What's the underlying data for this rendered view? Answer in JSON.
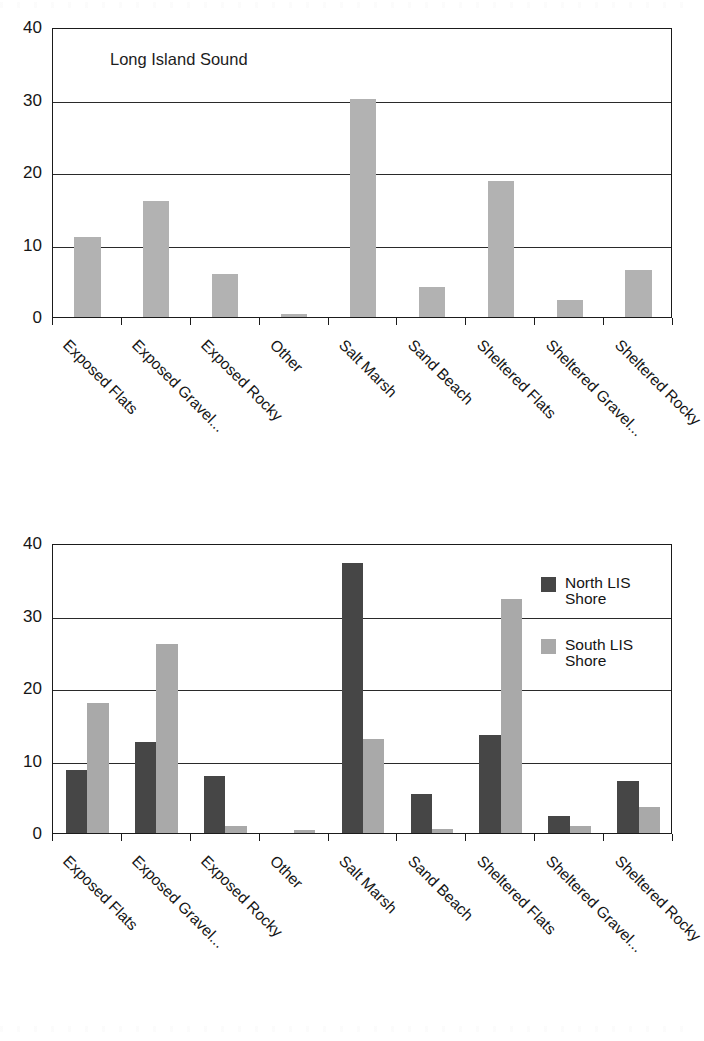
{
  "document": {
    "type": "scanned-figure-page",
    "page_background": "#ffffff"
  },
  "colors": {
    "north_series": "#464646",
    "south_series": "#a9a9a9",
    "single_series": "#b2b2b2",
    "axis": "#1b1b1b",
    "gridline": "#2a2a2a",
    "text": "#161616"
  },
  "categories": [
    "Exposed Flats",
    "Exposed Gravel...",
    "Exposed Rocky",
    "Other",
    "Salt Marsh",
    "Sand Beach",
    "Sheltered Flats",
    "Sheltered Gravel...",
    "Sheltered Rocky"
  ],
  "y_ticks": [
    "0",
    "10",
    "20",
    "30",
    "40"
  ],
  "top_chart": {
    "panel_label": "Long Island Sound"
  },
  "bottom_chart": {
    "legend": [
      {
        "label": "North LIS\nShore",
        "color": "#464646",
        "key": "north"
      },
      {
        "label": "South LIS\nShore",
        "color": "#a9a9a9",
        "key": "south"
      }
    ]
  },
  "chart_data": [
    {
      "type": "bar",
      "title": "Long Island Sound",
      "xlabel": "",
      "ylabel": "",
      "ylim": [
        0,
        40
      ],
      "yticks": [
        0,
        10,
        20,
        30,
        40
      ],
      "grid": true,
      "legend_position": "none",
      "categories": [
        "Exposed Flats",
        "Exposed Gravel...",
        "Exposed Rocky",
        "Other",
        "Salt Marsh",
        "Sand Beach",
        "Sheltered Flats",
        "Sheltered Gravel...",
        "Sheltered Rocky"
      ],
      "series": [
        {
          "name": "Long Island Sound",
          "color": "#b2b2b2",
          "values": [
            11.0,
            16.0,
            6.0,
            0.4,
            30.1,
            4.2,
            18.8,
            2.4,
            6.5
          ]
        }
      ]
    },
    {
      "type": "bar",
      "title": "",
      "xlabel": "",
      "ylabel": "",
      "ylim": [
        0,
        40
      ],
      "yticks": [
        0,
        10,
        20,
        30,
        40
      ],
      "grid": true,
      "legend_position": "top-right-inside",
      "categories": [
        "Exposed Flats",
        "Exposed Gravel...",
        "Exposed Rocky",
        "Other",
        "Salt Marsh",
        "Sand Beach",
        "Sheltered Flats",
        "Sheltered Gravel...",
        "Sheltered Rocky"
      ],
      "series": [
        {
          "name": "North LIS Shore",
          "color": "#464646",
          "values": [
            8.7,
            12.5,
            7.8,
            0.0,
            37.3,
            5.4,
            13.5,
            2.3,
            7.2
          ]
        },
        {
          "name": "South LIS Shore",
          "color": "#a9a9a9",
          "values": [
            17.9,
            26.1,
            1.0,
            0.4,
            12.9,
            0.5,
            32.3,
            1.0,
            3.6
          ]
        }
      ]
    }
  ]
}
